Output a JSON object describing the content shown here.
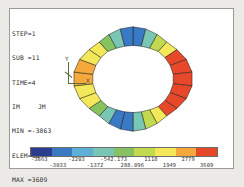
{
  "plot": {
    "title": "FEA Contour Plot",
    "background_color": "#ffffff",
    "page_color": "#eceae6",
    "border_color": "#9a9a96"
  },
  "info": {
    "step_label": "STEP=1",
    "sub_label": "SUB =11",
    "time_label": "TIME=4",
    "component_i": "IM",
    "component_j": "JM",
    "min_label": "MIN =-3863",
    "min_elem_label": "ELEM=13",
    "max_label": "MAX =3609",
    "max_elem_label": "ELEM=26",
    "min_value": -3863,
    "max_value": 3609,
    "min_element": 13,
    "max_element": 26,
    "step": 1,
    "sub": 11,
    "time": 4
  },
  "triad": {
    "x_label": "X",
    "y_label": "Y",
    "color": "#5a6d3a"
  },
  "chart_data": {
    "type": "heatmap",
    "xlabel": "",
    "ylabel": "",
    "colormap": "jet",
    "legend_position": "bottom",
    "grid": false,
    "value_range": [
      -3863,
      3609
    ],
    "legend_ticks_top": [
      "-3863",
      "-2203",
      "-542.173",
      "1118",
      "2779"
    ],
    "legend_ticks_bottom": [
      "-3033",
      "-1372",
      "288.096",
      "1949",
      "3609"
    ],
    "legend_ticks_all": [
      "-3863",
      "-3033",
      "-2203",
      "-1372",
      "-542.173",
      "288.096",
      "1118",
      "1949",
      "2779",
      "3609"
    ],
    "band_colors": [
      "#2b3d8f",
      "#3a79c4",
      "#5fb0d9",
      "#79c6b4",
      "#86c25f",
      "#c3d94f",
      "#f2e85a",
      "#f5a93c",
      "#e8482a"
    ],
    "band_count": 9,
    "elements": [
      {
        "id": 1,
        "angle": -90,
        "value": -3863,
        "color": "#2b3d8f"
      },
      {
        "id": 2,
        "angle": -76,
        "value": -3863,
        "color": "#2b3d8f"
      },
      {
        "id": 3,
        "angle": -62,
        "value": -3033,
        "color": "#3a79c4"
      },
      {
        "id": 4,
        "angle": -48,
        "value": -2203,
        "color": "#5fb0d9"
      },
      {
        "id": 5,
        "angle": -34,
        "value": -542,
        "color": "#86c25f"
      },
      {
        "id": 6,
        "angle": -20,
        "value": 288,
        "color": "#c3d94f"
      },
      {
        "id": 7,
        "angle": -6,
        "value": 1118,
        "color": "#f2e85a"
      },
      {
        "id": 8,
        "angle": 8,
        "value": 1949,
        "color": "#f5a93c"
      },
      {
        "id": 9,
        "angle": 22,
        "value": 2779,
        "color": "#e8482a"
      },
      {
        "id": 10,
        "angle": 36,
        "value": 3609,
        "color": "#e8482a"
      },
      {
        "id": 11,
        "angle": 50,
        "value": 2779,
        "color": "#f5a93c"
      },
      {
        "id": 12,
        "angle": 64,
        "value": 1118,
        "color": "#f2e85a"
      },
      {
        "id": 13,
        "angle": 78,
        "value": 288,
        "color": "#c3d94f"
      },
      {
        "id": 14,
        "angle": 92,
        "value": -542,
        "color": "#86c25f"
      },
      {
        "id": 15,
        "angle": 106,
        "value": -2203,
        "color": "#5fb0d9"
      },
      {
        "id": 16,
        "angle": 120,
        "value": -3033,
        "color": "#3a79c4"
      },
      {
        "id": 17,
        "angle": 134,
        "value": -3863,
        "color": "#2b3d8f"
      },
      {
        "id": 18,
        "angle": 148,
        "value": -3863,
        "color": "#2b3d8f"
      },
      {
        "id": 19,
        "angle": 162,
        "value": -3033,
        "color": "#3a79c4"
      },
      {
        "id": 20,
        "angle": 176,
        "value": -2203,
        "color": "#5fb0d9"
      },
      {
        "id": 21,
        "angle": 190,
        "value": -542,
        "color": "#86c25f"
      },
      {
        "id": 22,
        "angle": 204,
        "value": 288,
        "color": "#c3d94f"
      },
      {
        "id": 23,
        "angle": 218,
        "value": 1118,
        "color": "#f2e85a"
      },
      {
        "id": 24,
        "angle": 232,
        "value": 1949,
        "color": "#f5a93c"
      },
      {
        "id": 25,
        "angle": 246,
        "value": 2779,
        "color": "#f5a93c"
      },
      {
        "id": 26,
        "angle": 260,
        "value": 3609,
        "color": "#f2e85a"
      }
    ]
  }
}
